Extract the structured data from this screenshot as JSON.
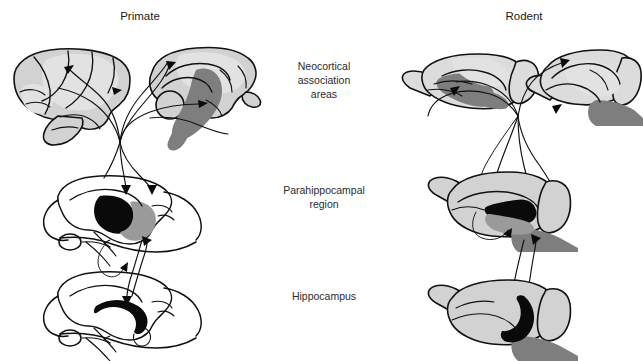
{
  "figure": {
    "title_left": "Primate",
    "title_right": "Rodent",
    "row_labels": {
      "neocortex_line1": "Neocortical",
      "neocortex_line2": "association",
      "neocortex_line3": "areas",
      "parahippocampal_line1": "Parahippocampal",
      "parahippocampal_line2": "region",
      "hippocampus": "Hippocampus"
    },
    "colors": {
      "background": "#ffffff",
      "ink": "#111111",
      "text": "#1a1a1a",
      "brain_fill": "#d2d2d2",
      "brain_fill_light": "#dcdcdc",
      "shade_pale": "#e2e2e2",
      "shade_mid": "#9a9a9a",
      "shade_dark": "#7e7e7e",
      "shade_black": "#0a0a0a"
    },
    "panels": [
      {
        "name": "primate-lateral-cortex",
        "column": "Primate",
        "row": "Neocortical association areas",
        "view": "lateral"
      },
      {
        "name": "primate-medial-cortex",
        "column": "Primate",
        "row": "Neocortical association areas",
        "view": "medial"
      },
      {
        "name": "rodent-lateral-cortex",
        "column": "Rodent",
        "row": "Neocortical association areas",
        "view": "lateral"
      },
      {
        "name": "rodent-medial-cortex",
        "column": "Rodent",
        "row": "Neocortical association areas",
        "view": "medial"
      },
      {
        "name": "primate-parahippocampal",
        "column": "Primate",
        "row": "Parahippocampal region",
        "view": "medial"
      },
      {
        "name": "rodent-parahippocampal",
        "column": "Rodent",
        "row": "Parahippocampal region",
        "view": "medial"
      },
      {
        "name": "primate-hippocampus",
        "column": "Primate",
        "row": "Hippocampus",
        "view": "medial"
      },
      {
        "name": "rodent-hippocampus",
        "column": "Rodent",
        "row": "Hippocampus",
        "view": "medial"
      }
    ]
  }
}
